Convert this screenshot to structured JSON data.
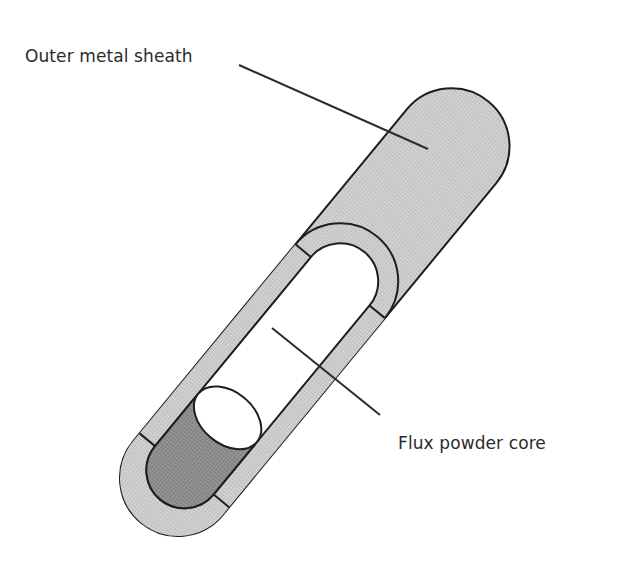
{
  "diagram": {
    "labels": [
      {
        "id": "outer-sheath",
        "text": "Outer metal sheath"
      },
      {
        "id": "flux-core",
        "text": "Flux powder core"
      }
    ],
    "colors": {
      "sheath": "#c9c9c9",
      "cut_face": "#d6d6d6",
      "flux_powder": "#8f8f8f",
      "hollow": "#ffffff",
      "outline": "#1e1e1e"
    }
  }
}
